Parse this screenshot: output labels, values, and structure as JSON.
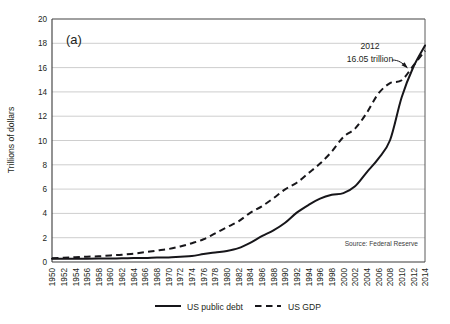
{
  "figure": {
    "panel_label": "(a)",
    "source_note": "Source: Federal Reserve",
    "annotation": {
      "line1": "2012",
      "line2": "16.05 trillion"
    }
  },
  "axes": {
    "y_title": "Trillions of dollars",
    "y_ticks": [
      "0",
      "2",
      "4",
      "6",
      "8",
      "10",
      "12",
      "14",
      "16",
      "18",
      "20"
    ],
    "x_ticks": [
      "1950",
      "1952",
      "1954",
      "1956",
      "1958",
      "1960",
      "1962",
      "1964",
      "1966",
      "1968",
      "1970",
      "1972",
      "1974",
      "1976",
      "1978",
      "1980",
      "1982",
      "1984",
      "1986",
      "1988",
      "1990",
      "1992",
      "1994",
      "1996",
      "1998",
      "2000",
      "2002",
      "2004",
      "2006",
      "2008",
      "2010",
      "2012",
      "2014"
    ]
  },
  "legend": {
    "items": [
      {
        "label": "US public debt",
        "style": "solid"
      },
      {
        "label": "US GDP",
        "style": "dashed"
      }
    ]
  },
  "colors": {
    "line": "#17161a",
    "grid": "#b9b9b9",
    "axis": "#3a3a3a",
    "text": "#231f20",
    "background": "#ffffff"
  },
  "chart_data": {
    "type": "line",
    "title": "",
    "subtitle": "",
    "xlabel": "",
    "ylabel": "Trillions of dollars",
    "xlim": [
      1950,
      2014
    ],
    "ylim": [
      0,
      20
    ],
    "y_tick_step": 2,
    "x_tick_step": 2,
    "grid": true,
    "legend_position": "bottom",
    "annotations": [
      {
        "text": "2012\n16.05 trillion",
        "x": 2012,
        "y": 16.05,
        "points_to_series": "US public debt"
      },
      {
        "text": "Source: Federal Reserve",
        "position": "inside-bottom-right"
      },
      {
        "text": "(a)",
        "position": "inside-top-left"
      }
    ],
    "x": [
      1950,
      1952,
      1954,
      1956,
      1958,
      1960,
      1962,
      1964,
      1966,
      1968,
      1970,
      1972,
      1974,
      1976,
      1978,
      1980,
      1982,
      1984,
      1986,
      1988,
      1990,
      1992,
      1994,
      1996,
      1998,
      2000,
      2002,
      2004,
      2006,
      2008,
      2010,
      2012,
      2014
    ],
    "series": [
      {
        "name": "US public debt",
        "style": "solid",
        "values": [
          0.26,
          0.26,
          0.27,
          0.27,
          0.28,
          0.29,
          0.3,
          0.32,
          0.33,
          0.37,
          0.38,
          0.44,
          0.49,
          0.65,
          0.79,
          0.91,
          1.14,
          1.58,
          2.13,
          2.6,
          3.23,
          4.06,
          4.69,
          5.22,
          5.53,
          5.67,
          6.23,
          7.38,
          8.51,
          10.02,
          13.56,
          16.05,
          17.82
        ]
      },
      {
        "name": "US GDP",
        "style": "dashed",
        "values": [
          0.3,
          0.36,
          0.39,
          0.44,
          0.47,
          0.54,
          0.6,
          0.69,
          0.81,
          0.94,
          1.07,
          1.28,
          1.55,
          1.87,
          2.36,
          2.86,
          3.35,
          4.04,
          4.58,
          5.25,
          5.98,
          6.52,
          7.31,
          8.1,
          9.09,
          10.29,
          10.98,
          12.27,
          13.86,
          14.72,
          14.96,
          16.16,
          17.39
        ]
      }
    ]
  }
}
